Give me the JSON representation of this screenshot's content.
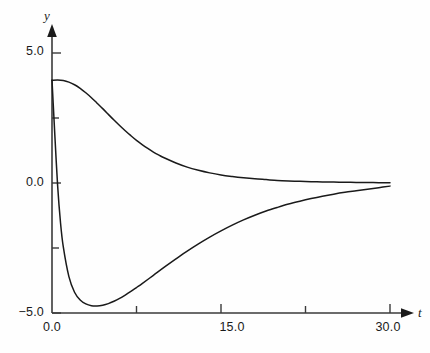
{
  "chart_data": {
    "type": "line",
    "title": "",
    "subtitle": "",
    "xlabel": "t",
    "ylabel": "y",
    "xlim": [
      0.0,
      31.5
    ],
    "ylim": [
      -5.0,
      6.2
    ],
    "grid": false,
    "legend": "none",
    "axis_style": "arrow-terminated half-axes",
    "x_ticks_major": [
      0.0,
      15.0,
      30.0
    ],
    "x_tick_labels": [
      "0.0",
      "15.0",
      "30.0"
    ],
    "x_ticks_minor": [
      7.5,
      22.5
    ],
    "y_ticks_major": [
      5.0,
      0.0,
      -5.0
    ],
    "y_tick_labels": [
      "5.0",
      "0.0",
      "−5.0"
    ],
    "y_ticks_minor": [
      2.5,
      -2.5
    ],
    "line_color": "#1a1a1a",
    "series": [
      {
        "name": "upper-decay-curve",
        "x": [
          0.0,
          0.5,
          1.0,
          1.5,
          2.0,
          2.5,
          3.0,
          3.5,
          4.0,
          4.5,
          5.0,
          5.5,
          6.0,
          6.5,
          7.0,
          7.5,
          8.0,
          8.5,
          9.0,
          9.5,
          10.0,
          11.0,
          12.0,
          13.0,
          14.0,
          15.0,
          16.0,
          17.0,
          18.0,
          19.0,
          20.0,
          21.0,
          22.0,
          23.0,
          24.0,
          25.0,
          26.0,
          27.0,
          28.0,
          29.0,
          30.0
        ],
        "y": [
          3.95,
          3.96,
          3.94,
          3.88,
          3.78,
          3.64,
          3.47,
          3.28,
          3.07,
          2.86,
          2.64,
          2.42,
          2.21,
          2.01,
          1.82,
          1.64,
          1.48,
          1.33,
          1.19,
          1.07,
          0.96,
          0.77,
          0.61,
          0.49,
          0.39,
          0.31,
          0.25,
          0.2,
          0.16,
          0.13,
          0.1,
          0.08,
          0.065,
          0.052,
          0.042,
          0.034,
          0.027,
          0.022,
          0.017,
          0.014,
          0.011
        ]
      },
      {
        "name": "lower-undershoot-curve",
        "x": [
          0.0,
          0.1,
          0.25,
          0.5,
          0.75,
          1.0,
          1.5,
          2.0,
          2.5,
          3.0,
          3.5,
          4.0,
          4.5,
          5.0,
          5.5,
          6.0,
          6.5,
          7.0,
          7.5,
          8.0,
          9.0,
          10.0,
          11.0,
          12.0,
          13.0,
          14.0,
          15.0,
          16.0,
          17.0,
          18.0,
          19.0,
          20.0,
          21.0,
          22.0,
          23.0,
          24.0,
          25.0,
          26.0,
          27.0,
          28.0,
          29.0,
          30.0
        ],
        "y": [
          3.95,
          3.1,
          1.85,
          -0.1,
          -1.5,
          -2.45,
          -3.6,
          -4.2,
          -4.5,
          -4.65,
          -4.72,
          -4.73,
          -4.7,
          -4.64,
          -4.55,
          -4.44,
          -4.31,
          -4.17,
          -4.02,
          -3.87,
          -3.55,
          -3.23,
          -2.92,
          -2.62,
          -2.34,
          -2.08,
          -1.84,
          -1.62,
          -1.42,
          -1.24,
          -1.08,
          -0.94,
          -0.81,
          -0.7,
          -0.6,
          -0.51,
          -0.43,
          -0.36,
          -0.3,
          -0.24,
          -0.18,
          -0.12
        ]
      }
    ],
    "annotations": []
  },
  "axes": {
    "y_axis_name": "y",
    "x_axis_name": "t"
  }
}
